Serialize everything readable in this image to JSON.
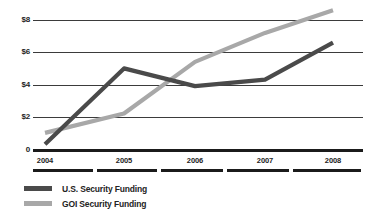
{
  "chart_data": {
    "type": "line",
    "title": "",
    "subtitle": "",
    "xlabel": "",
    "ylabel": "",
    "categories": [
      "2004",
      "2005",
      "2006",
      "2007",
      "2008"
    ],
    "ylim": [
      0,
      9
    ],
    "yticks": [
      "0",
      "$2",
      "$4",
      "$6",
      "$8"
    ],
    "ytick_values": [
      0,
      2,
      4,
      6,
      8
    ],
    "grid": true,
    "legend_position": "bottom-left",
    "value_unit": "billions of dollars",
    "series": [
      {
        "name": "U.S. Security Funding",
        "color": "#4a4a4a",
        "values": [
          0.3,
          5.0,
          3.9,
          4.3,
          6.6
        ]
      },
      {
        "name": "GOI Security Funding",
        "color": "#a8a8a8",
        "values": [
          1.0,
          2.2,
          5.4,
          7.2,
          8.6
        ]
      }
    ]
  },
  "legend": {
    "items": [
      {
        "label": "U.S. Security Funding",
        "color": "#4a4a4a"
      },
      {
        "label": "GOI Security Funding",
        "color": "#a8a8a8"
      }
    ]
  },
  "axis": {
    "y_labels": [
      "$8",
      "$6",
      "$4",
      "$2",
      "0"
    ],
    "x_labels": [
      "2004",
      "2005",
      "2006",
      "2007",
      "2008"
    ]
  },
  "colors": {
    "us_series": "#4a4a4a",
    "goi_series": "#a8a8a8",
    "gridline": "#3b3b3b",
    "baseline": "#1b1b1b",
    "text": "#232323",
    "background": "#ffffff"
  }
}
